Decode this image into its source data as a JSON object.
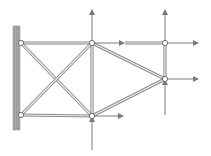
{
  "diagram": {
    "type": "truss",
    "colors": {
      "background": "#ffffff",
      "member_outline": "#8a8a8a",
      "member_fill": "#f2f2f2",
      "arrow": "#7a7a7a",
      "wall": "#a8a8a8",
      "wall_hatch": "#8c8c8c",
      "node_fill": "#ffffff",
      "node_stroke": "#6e6e6e"
    },
    "wall": {
      "x": 13,
      "y": 26,
      "width": 7,
      "height": 104
    },
    "nodes": [
      {
        "id": "A",
        "x": 21,
        "y": 43,
        "label": ""
      },
      {
        "id": "B",
        "x": 21,
        "y": 115,
        "label": ""
      },
      {
        "id": "C",
        "x": 92,
        "y": 43,
        "label": ""
      },
      {
        "id": "D",
        "x": 92,
        "y": 116,
        "label": ""
      },
      {
        "id": "E",
        "x": 165,
        "y": 43,
        "label": ""
      },
      {
        "id": "F",
        "x": 165,
        "y": 79,
        "label": ""
      }
    ],
    "members": [
      {
        "from": "A",
        "to": "C"
      },
      {
        "from": "B",
        "to": "D"
      },
      {
        "from": "A",
        "to": "D"
      },
      {
        "from": "B",
        "to": "C"
      },
      {
        "from": "C",
        "to": "D"
      },
      {
        "from": "C",
        "to": "F"
      },
      {
        "from": "D",
        "to": "F"
      },
      {
        "from": "E",
        "to": "F"
      },
      {
        "x1": 125,
        "y1": 43,
        "x2": 165,
        "y2": 43
      }
    ],
    "forces": [
      {
        "node": "C",
        "x1": 92,
        "y1": 43,
        "x2": 92,
        "y2": 10,
        "direction": "up"
      },
      {
        "node": "C",
        "x1": 92,
        "y1": 43,
        "x2": 124,
        "y2": 43,
        "direction": "right"
      },
      {
        "node": "E",
        "x1": 165,
        "y1": 43,
        "x2": 165,
        "y2": 10,
        "direction": "up"
      },
      {
        "node": "E",
        "x1": 165,
        "y1": 43,
        "x2": 198,
        "y2": 43,
        "direction": "right"
      },
      {
        "node": "F",
        "x1": 165,
        "y1": 79,
        "x2": 198,
        "y2": 79,
        "direction": "right"
      },
      {
        "node": "F",
        "x1": 165,
        "y1": 115,
        "x2": 165,
        "y2": 80,
        "direction": "up"
      },
      {
        "node": "D",
        "x1": 92,
        "y1": 116,
        "x2": 123,
        "y2": 116,
        "direction": "right"
      },
      {
        "node": "D",
        "x1": 92,
        "y1": 150,
        "x2": 92,
        "y2": 117,
        "direction": "up"
      }
    ]
  }
}
